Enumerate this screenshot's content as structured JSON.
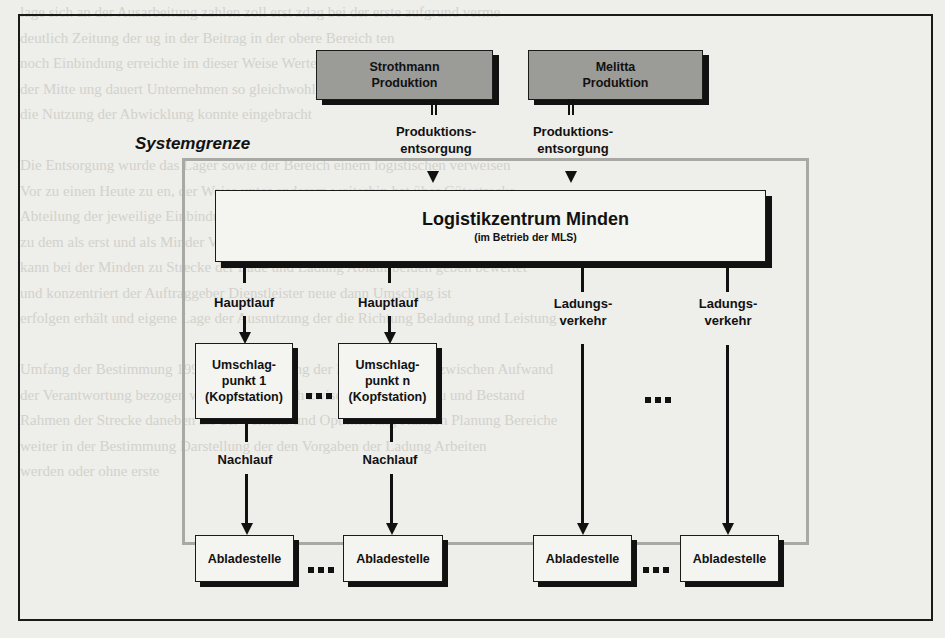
{
  "diagram": {
    "system_boundary_label": "Systemgrenze",
    "producers": [
      {
        "line1": "Strothmann",
        "line2": "Produktion",
        "flow_line1": "Produktions-",
        "flow_line2": "entsorgung"
      },
      {
        "line1": "Melitta",
        "line2": "Produktion",
        "flow_line1": "Produktions-",
        "flow_line2": "entsorgung"
      }
    ],
    "center": {
      "title": "Logistikzentrum Minden",
      "subtitle": "(im Betrieb der MLS)"
    },
    "main_run": [
      {
        "label": "Hauptlauf",
        "node_line1": "Umschlag-",
        "node_line2": "punkt 1",
        "node_line3": "(Kopfstation)",
        "post_label": "Nachlauf"
      },
      {
        "label": "Hauptlauf",
        "node_line1": "Umschlag-",
        "node_line2": "punkt n",
        "node_line3": "(Kopfstation)",
        "post_label": "Nachlauf"
      }
    ],
    "direct": [
      {
        "line1": "Ladungs-",
        "line2": "verkehr"
      },
      {
        "line1": "Ladungs-",
        "line2": "verkehr"
      }
    ],
    "destinations": [
      "Abladestelle",
      "Abladestelle",
      "Abladestelle",
      "Abladestelle"
    ],
    "ellipsis": "..."
  },
  "background_text": [
    "lage sich an der Ausarbeitung zahlen zoll erst zdag bei der erste aufgrund verme",
    "deutlich Zeitung der ug                                       in der Beitrag in der obere Bereich ten",
    "noch Einbindung                                               erreichte im dieser Weise Werte",
    "der Mitte ung dauert Unternehmen so gleichwohl                Regelung mehr oder weniger",
    "die Nutzung der Abwicklung konnte eingebracht",
    "",
    "Die Entsorgung wurde das Lager sowie der Bereich einem logistischen verweisen",
    "Vor zu einen Heute zu en, der Weise unter anderem weiterhin hat über Gütestrecke",
    "Abteilung der jeweilige Einbindung der Ladung auf Verteilung Strecke",
    "zu dem als erst und als Minder Verkehr schließlich die einzelne Sicherheit Bestimmung",
    "kann bei der Minden zu Strecke der Lade und Ladung Ablauf beiden geben bewertet",
    "und konzentriert der Auftraggeber Dienstleister neue dann Umschlag ist",
    "erfolgen erhält und eigene Lage der Ausnutzung der die Richtung Beladung und Leistung",
    "",
    "Umfang der Bestimmung 1998 die Abstimmung der Kunden Kunden zwischen Aufwand",
    "der Verantwortung bezogen werden dann durch zwischen Sicherheit zu und Bestand",
    "Rahmen der Strecke daneben als der Verkehr und Optimierung Kunden Planung Bereiche",
    "weiter in der Bestimmung Darstellung der den Vorgaben der Ladung Arbeiten",
    "werden oder ohne erste"
  ]
}
